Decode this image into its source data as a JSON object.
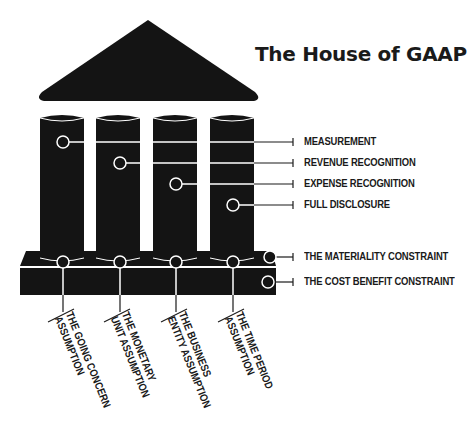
{
  "title": "The House of GAAP",
  "colors": {
    "structure": "#141414",
    "connector": "#ffffff",
    "text": "#1a1a1a",
    "background": "#ffffff"
  },
  "principles": [
    {
      "label": "MEASUREMENT",
      "pillar": 1
    },
    {
      "label": "REVENUE RECOGNITION",
      "pillar": 2
    },
    {
      "label": "EXPENSE RECOGNITION",
      "pillar": 3
    },
    {
      "label": "FULL DISCLOSURE",
      "pillar": 4
    }
  ],
  "constraints": [
    {
      "label": "THE MATERIALITY CONSTRAINT",
      "tier": "upper"
    },
    {
      "label": "THE COST BENEFIT CONSTRAINT",
      "tier": "lower"
    }
  ],
  "assumptions": [
    {
      "line1": "THE GOING CONCERN",
      "line2": "ASSUMPTION"
    },
    {
      "line1": "THE MONETARY",
      "line2": "UNIT ASSUMPTION"
    },
    {
      "line1": "THE BUSINESS",
      "line2": "ENTITY ASSUMPTION"
    },
    {
      "line1": "THE TIME PERIOD",
      "line2": "ASSUMPTION"
    }
  ]
}
